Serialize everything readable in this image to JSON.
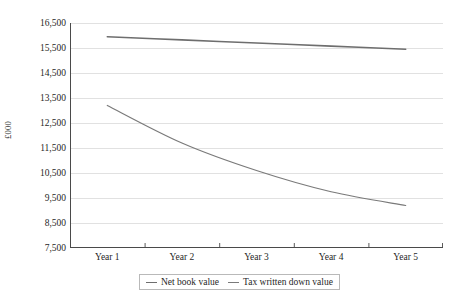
{
  "chart_data": {
    "type": "line",
    "title": "",
    "xlabel": "",
    "ylabel": "£000",
    "categories": [
      "Year 1",
      "Year 2",
      "Year 3",
      "Year 4",
      "Year 5"
    ],
    "ylim": [
      7500,
      16500
    ],
    "y_ticks": [
      16500,
      15500,
      14500,
      13500,
      12500,
      11500,
      10500,
      9500,
      8500,
      7500
    ],
    "y_tick_labels": [
      "16,500",
      "15,500",
      "14,500",
      "13,500",
      "12,500",
      "11,500",
      "10,500",
      "9,500",
      "8,500",
      "7,500"
    ],
    "grid": true,
    "legend_position": "bottom-center",
    "series": [
      {
        "name": "Net book value",
        "color": "#6e6e6e",
        "values": [
          15950,
          15825,
          15700,
          15575,
          15450
        ]
      },
      {
        "name": "Tax written down value",
        "color": "#7a7a7a",
        "values": [
          13200,
          11700,
          10600,
          9750,
          9200
        ]
      }
    ]
  },
  "axes": {
    "y_title": "£000"
  },
  "legend": {
    "entries": [
      {
        "label": "Net book value"
      },
      {
        "label": "Tax written down value"
      }
    ]
  },
  "colors": {
    "series_net_book_value": "#6e6e6e",
    "series_tax_written_down_value": "#7a7a7a",
    "gridline": "#d9d9d9",
    "axis": "#4a4a4a",
    "text": "#1f1f1f",
    "background": "#ffffff"
  }
}
